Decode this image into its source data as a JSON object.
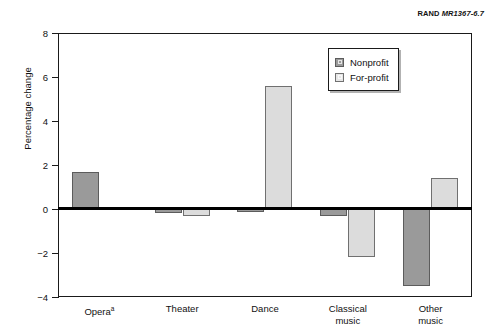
{
  "source_credit": {
    "org": "RAND",
    "ref": "MR1367-6.7"
  },
  "chart_data": {
    "type": "bar",
    "title": "",
    "subtitle": "",
    "xlabel": "",
    "ylabel": "Percentage change",
    "categories": [
      "Opera",
      "Theater",
      "Dance",
      "Classical music",
      "Other music"
    ],
    "category_footnotes": [
      "a",
      "",
      "",
      "",
      ""
    ],
    "category_lines": [
      [
        "Opera"
      ],
      [
        "Theater"
      ],
      [
        "Dance"
      ],
      [
        "Classical",
        "music"
      ],
      [
        "Other",
        "music"
      ]
    ],
    "series": [
      {
        "name": "Nonprofit",
        "color": "#9a9a9a",
        "values": [
          1.7,
          -0.2,
          -0.15,
          -0.3,
          -3.5
        ]
      },
      {
        "name": "For-profit",
        "color": "#dcdcdc",
        "values": [
          0,
          -0.3,
          5.6,
          -2.2,
          1.4
        ]
      }
    ],
    "ylim": [
      -4,
      8
    ],
    "yticks": [
      8,
      6,
      4,
      2,
      0,
      -2,
      -4
    ],
    "ytick_labels": [
      "8",
      "6",
      "4",
      "2",
      "0",
      "−2",
      "−4"
    ],
    "grid": false,
    "legend_position": "top-right",
    "zero_line": true
  },
  "legend": {
    "items": [
      {
        "label": "Nonprofit",
        "swatch": "nonprofit-swatch"
      },
      {
        "label": "For-profit",
        "swatch": "forprofit-swatch"
      }
    ]
  }
}
